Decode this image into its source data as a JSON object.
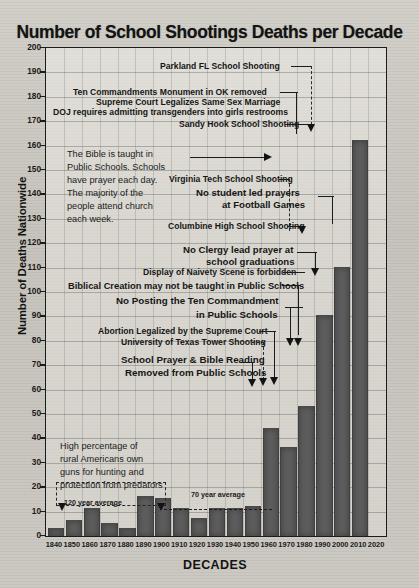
{
  "chart_data": {
    "type": "bar",
    "title": "Number of School Shootings Deaths per Decade",
    "xlabel": "DECADES",
    "ylabel": "Number of Deaths Nationwide",
    "ylim": [
      0,
      200
    ],
    "ytick_step": 10,
    "grid": true,
    "legend": "none",
    "categories": [
      "1840",
      "1850",
      "1860",
      "1870",
      "1880",
      "1890",
      "1900",
      "1910",
      "1920",
      "1930",
      "1940",
      "1950",
      "1960",
      "1970",
      "1980",
      "1990",
      "2000",
      "2010",
      "2020"
    ],
    "values": [
      3,
      6,
      11,
      5,
      3,
      16,
      15,
      11,
      7,
      11,
      11,
      12,
      44,
      36,
      53,
      90,
      110,
      162,
      0
    ],
    "ytick_labels": [
      "200",
      "190",
      "180",
      "170",
      "160",
      "150",
      "140",
      "130",
      "120",
      "110",
      "100",
      "90",
      "80",
      "70",
      "60",
      "50",
      "40",
      "30",
      "20",
      "10",
      "0"
    ],
    "reference_lines": [
      {
        "label": "120 year average",
        "value": 9,
        "from": "1840",
        "to": "1960"
      },
      {
        "label": "70 year average",
        "value": 10,
        "from": "1890",
        "to": "1960"
      }
    ],
    "annotations": [
      {
        "id": "parkland",
        "text": "Parkland FL School Shooting",
        "target_decade": "2010",
        "style": "thin"
      },
      {
        "id": "ten-commandments-ok",
        "text": "Ten Commandments Monument in OK removed",
        "target_decade": "2010",
        "style": "thin"
      },
      {
        "id": "same-sex-marriage",
        "text": "Supreme Court Legalizes Same Sex Marriage",
        "target_decade": "2010",
        "style": "thin"
      },
      {
        "id": "doj-transgender",
        "text": "DOJ requires admitting transgenders into girls restrooms",
        "target_decade": "2010",
        "style": "thin"
      },
      {
        "id": "sandy-hook",
        "text": "Sandy Hook School Shooting",
        "target_decade": "2010",
        "style": "thin"
      },
      {
        "id": "virginia-tech",
        "text": "Virginia Tech School Shooting",
        "target_decade": "2000",
        "style": "thin"
      },
      {
        "id": "no-student-led-prayers",
        "text": "No student led prayers",
        "target_decade": "2000",
        "style": "bold"
      },
      {
        "id": "at-football-games",
        "text": "at Football Games",
        "target_decade": "2000",
        "style": "bold"
      },
      {
        "id": "columbine",
        "text": "Columbine High School Shooting",
        "target_decade": "1990",
        "style": "thin"
      },
      {
        "id": "no-clergy-prayer",
        "text": "No Clergy lead prayer at",
        "target_decade": "1990",
        "style": "bold"
      },
      {
        "id": "school-graduations",
        "text": "school graduations",
        "target_decade": "1990",
        "style": "bold"
      },
      {
        "id": "naivety-scene",
        "text": "Display of Naivety Scene is forbidden",
        "target_decade": "1990",
        "style": "thin"
      },
      {
        "id": "biblical-creation",
        "text": "Biblical Creation may not be taught in Public Schools",
        "target_decade": "1980",
        "style": "bold"
      },
      {
        "id": "no-posting-ten",
        "text": "No Posting the Ten Commandment",
        "target_decade": "1980",
        "style": "bold"
      },
      {
        "id": "in-public-schools",
        "text": "in Public Schools",
        "target_decade": "1980",
        "style": "bold"
      },
      {
        "id": "abortion-legalized",
        "text": "Abortion Legalized by the Supreme Court",
        "target_decade": "1970",
        "style": "thin"
      },
      {
        "id": "ut-tower",
        "text": "University of Texas Tower Shooting",
        "target_decade": "1960",
        "style": "thin"
      },
      {
        "id": "school-prayer-bible",
        "text": "School Prayer & Bible Reading",
        "target_decade": "1960",
        "style": "bold"
      },
      {
        "id": "removed-public-schools",
        "text": "Removed from Public Schools",
        "target_decade": "1960",
        "style": "bold"
      }
    ],
    "text_blocks": [
      {
        "id": "bible-taught-block",
        "lines": [
          "The Bible is taught in",
          "Public Schools. Schools",
          "have prayer each day.",
          "The majority of the",
          "people attend church",
          "each week."
        ]
      },
      {
        "id": "gun-ownership-block",
        "lines": [
          "High percentage of",
          "rural Americans own",
          "guns for hunting and",
          "protection from predators"
        ]
      }
    ],
    "colors": {
      "bar": "#5d5d5d",
      "background": "#c9c6bf",
      "text": "#161616",
      "axis": "#1b1b1b"
    }
  }
}
